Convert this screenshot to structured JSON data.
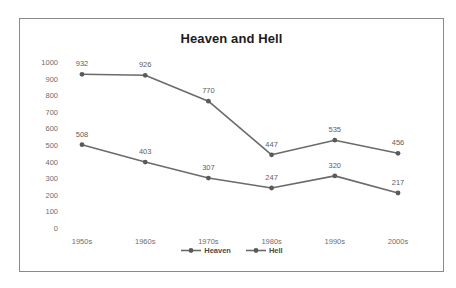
{
  "chart_data": {
    "type": "line",
    "title": "Heaven and Hell",
    "xlabel": "",
    "ylabel": "",
    "categories": [
      "1950s",
      "1960s",
      "1970s",
      "1980s",
      "1990s",
      "2000s"
    ],
    "series": [
      {
        "name": "Heaven",
        "values": [
          932,
          926,
          770,
          447,
          535,
          456
        ],
        "color": "#6b6b6b",
        "marker": "circle"
      },
      {
        "name": "Hell",
        "values": [
          508,
          403,
          307,
          247,
          320,
          217
        ],
        "color": "#6b6b6b",
        "marker": "circle"
      }
    ],
    "ylim": [
      0,
      1000
    ],
    "ytick_labels": [
      "1000",
      "900",
      "800",
      "700",
      "600",
      "500",
      "400",
      "300",
      "200",
      "100",
      "0"
    ],
    "ytick_values": [
      1000,
      900,
      800,
      700,
      600,
      500,
      400,
      300,
      200,
      100,
      0
    ],
    "grid": false,
    "legend_position": "bottom",
    "data_labels_shown": true
  },
  "style": {
    "line_color": "#6b6b6b",
    "marker_color": "#5a5a5a",
    "frame_color": "#8a8a8a",
    "tick_text_color": "#6e6e6e",
    "label_text_color": "#5e5e5e",
    "title_color": "#1c1c1c",
    "background": "#ffffff"
  },
  "legend": {
    "items": [
      {
        "label": "Heaven"
      },
      {
        "label": "Hell"
      }
    ]
  }
}
